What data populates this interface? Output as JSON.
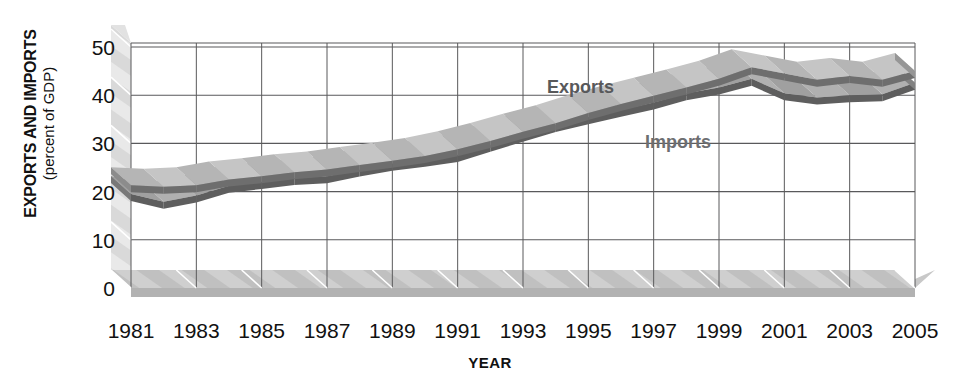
{
  "chart_data": {
    "type": "line",
    "title": "",
    "subtitle": "",
    "xlabel": "YEAR",
    "ylabel": "EXPORTS AND IMPORTS",
    "ylabel_sub": "(percent of GDP)",
    "ylim": [
      0,
      50
    ],
    "xlim": [
      1981,
      2005
    ],
    "grid": true,
    "legend_position": "inline-annotation",
    "style": "3d-ribbon",
    "y_ticks": [
      "0",
      "10",
      "20",
      "30",
      "40",
      "50"
    ],
    "y_tick_values": [
      0,
      10,
      20,
      30,
      40,
      50
    ],
    "x_ticks": [
      "1981",
      "1983",
      "1985",
      "1987",
      "1989",
      "1991",
      "1993",
      "1995",
      "1997",
      "1999",
      "2001",
      "2003",
      "2005"
    ],
    "x_tick_values": [
      1981,
      1983,
      1985,
      1987,
      1989,
      1991,
      1993,
      1995,
      1997,
      1999,
      2001,
      2003,
      2005
    ],
    "x": [
      1981,
      1982,
      1983,
      1984,
      1985,
      1986,
      1987,
      1988,
      1989,
      1990,
      1991,
      1992,
      1993,
      1994,
      1995,
      1996,
      1997,
      1998,
      1999,
      2000,
      2001,
      2002,
      2003,
      2004,
      2005
    ],
    "series": [
      {
        "name": "Exports",
        "color": "#8c8c8c",
        "top_color": "#b5b5b5",
        "edge_color": "#6e6e6e",
        "label_color": "#58595b",
        "values": [
          21.3,
          21.0,
          21.3,
          22.5,
          23.2,
          24.0,
          24.6,
          25.5,
          26.4,
          27.4,
          28.8,
          30.5,
          32.4,
          34.2,
          36.3,
          38.2,
          39.9,
          41.6,
          43.4,
          45.8,
          44.5,
          43.2,
          44.0,
          43.2,
          45.0
        ]
      },
      {
        "name": "Imports",
        "color": "#787878",
        "top_color": "#a0a0a0",
        "edge_color": "#5e5e5e",
        "label_color": "#6d6e71",
        "values": [
          19.5,
          17.9,
          19.2,
          21.2,
          22.0,
          22.8,
          23.2,
          24.6,
          25.8,
          26.6,
          27.6,
          29.7,
          31.8,
          33.8,
          35.4,
          37.0,
          38.5,
          40.4,
          41.6,
          43.4,
          40.4,
          39.5,
          40.0,
          40.2,
          42.6
        ]
      }
    ],
    "annotations": [
      {
        "text": "Exports",
        "x_px": 547,
        "y_px": 77
      },
      {
        "text": "Imports",
        "x_px": 645,
        "y_px": 132
      }
    ]
  },
  "colors": {
    "gridline": "#59595b",
    "floor_top": "#bdbdbd",
    "floor_front": "#9f9f9f",
    "wall": "#d6d6d6",
    "wall_hatch": "#e8e8e8",
    "text": "#111111",
    "background": "#ffffff"
  }
}
